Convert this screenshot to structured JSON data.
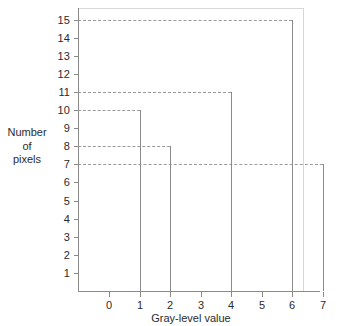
{
  "chart_data": {
    "type": "bar",
    "title": "",
    "subtitle": "",
    "xlabel": "Gray-level value",
    "ylabel": "Number of pixels",
    "ylabel_lines": [
      "Number",
      "of",
      "pixels"
    ],
    "categories": [
      "0",
      "1",
      "2",
      "3",
      "4",
      "5",
      "6",
      "7"
    ],
    "values": [
      0,
      10,
      8,
      0,
      11,
      0,
      15,
      7
    ],
    "xticklabels": [
      "0",
      "1",
      "2",
      "3",
      "4",
      "5",
      "6",
      "7"
    ],
    "yticklabels": [
      "15",
      "14",
      "13",
      "12",
      "11",
      "10",
      "9",
      "8",
      "7",
      "6",
      "5",
      "4",
      "3",
      "2",
      "1"
    ],
    "ylim": [
      0,
      15.4
    ],
    "xlim": [
      -0.6,
      7.8
    ],
    "grid": false,
    "reference_lines": [
      15,
      11,
      10,
      8,
      7
    ],
    "reference_line_style": "dashed",
    "legend": [],
    "annotations": [],
    "colors": {
      "axis": "#8a8a8a",
      "frame": "#d8d8d8",
      "stem": "#8a8a8a",
      "dashed": "#9a9a9a",
      "text": "#2b2b2b",
      "background": "#ffffff"
    }
  }
}
